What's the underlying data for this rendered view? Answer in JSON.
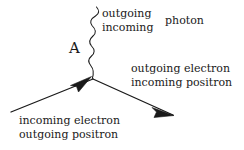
{
  "diagram": {
    "background_color": "#ffffff",
    "stroke_color": "#1a1a1a",
    "labels": {
      "vertex": "A",
      "photon_outgoing": "outgoing",
      "photon_incoming": "incoming",
      "photon_name": "photon",
      "right_outgoing": "outgoing electron",
      "right_incoming": "incoming positron",
      "left_incoming": "incoming electron",
      "left_outgoing": "outgoing positron"
    },
    "lines": {
      "photon_line": {
        "kind": "wavy",
        "x": 93,
        "y_top": 7,
        "y_bottom": 78,
        "amplitude": 5,
        "wavelength": 11
      },
      "incoming_fermion": {
        "kind": "straight-arrow",
        "from_x": 11,
        "from_y": 112,
        "to_x": 93,
        "to_y": 79,
        "arrow_at": 0.84
      },
      "outgoing_fermion": {
        "kind": "straight-arrow",
        "from_x": 93,
        "from_y": 79,
        "to_x": 173,
        "to_y": 115,
        "arrow_at": 0.97
      }
    }
  }
}
